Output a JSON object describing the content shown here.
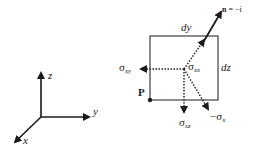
{
  "diagram": {
    "axes": {
      "z_label": "z",
      "y_label": "y",
      "x_label": "x"
    },
    "element": {
      "width_label": "dy",
      "height_label": "dz",
      "corner_point_label": "P",
      "normal_label_bold": "n",
      "normal_label_rest": " = −i"
    },
    "stresses": {
      "sigma_xx": {
        "symbol": "σ",
        "sub": "xx"
      },
      "sigma_xy": {
        "symbol": "σ",
        "sub": "xy"
      },
      "sigma_xz": {
        "symbol": "σ",
        "sub": "xz"
      },
      "neg_sigma_x": {
        "symbol": "−σ",
        "sub": "x"
      }
    },
    "colors": {
      "stroke": "#1a1a1a",
      "background": "#ffffff"
    }
  }
}
